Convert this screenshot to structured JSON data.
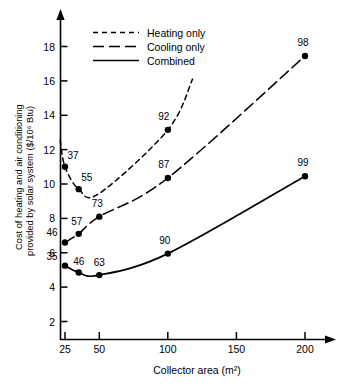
{
  "chart_data": {
    "type": "line",
    "title": "",
    "xlabel": "Collector area (m²)",
    "ylabel": "Cost of heating and air conditioning provided by solar system ($/10⁶ Btu)",
    "ylabel_line1": "Cost of heating and air conditioning",
    "ylabel_line2": "provided by solar system ($/10⁶ Btu)",
    "xlim": [
      20,
      215
    ],
    "ylim": [
      0,
      19.4
    ],
    "xticks": [
      25,
      50,
      100,
      150,
      200
    ],
    "xtick_labels": [
      "25",
      "50",
      "100",
      "150",
      "200"
    ],
    "yticks": [
      2,
      4,
      6,
      8,
      10,
      12,
      14,
      16,
      18
    ],
    "ytick_labels": [
      "2",
      "4",
      "6",
      "8",
      "10",
      "12",
      "14",
      "16",
      "18"
    ],
    "grid": false,
    "legend_position": "top-left-inside",
    "axis_arrows": true,
    "series": [
      {
        "name": "Heating only",
        "style": "short-dashed",
        "color": "#000000",
        "x": [
          25,
          35,
          50,
          100
        ],
        "y": [
          11.0,
          9.7,
          9.45,
          13.15
        ],
        "point_labels": [
          "37",
          "55",
          "",
          "92"
        ],
        "marker_x": [
          25,
          35,
          100
        ],
        "marker_y": [
          11.0,
          9.7,
          13.15
        ],
        "marker_labels": [
          "37",
          "55",
          "92"
        ],
        "extends_beyond_last_point": true
      },
      {
        "name": "Cooling only",
        "style": "long-dashed",
        "color": "#000000",
        "x": [
          25,
          35,
          50,
          100,
          200
        ],
        "y": [
          6.6,
          7.1,
          8.1,
          10.35,
          17.45
        ],
        "point_labels": [
          "46",
          "57",
          "73",
          "87",
          "98"
        ],
        "marker_x": [
          25,
          35,
          50,
          100,
          200
        ],
        "marker_y": [
          6.6,
          7.1,
          8.1,
          10.35,
          17.45
        ],
        "marker_labels": [
          "46",
          "57",
          "73",
          "87",
          "98"
        ]
      },
      {
        "name": "Combined",
        "style": "solid",
        "color": "#000000",
        "x": [
          25,
          35,
          50,
          100,
          200
        ],
        "y": [
          5.25,
          4.85,
          4.7,
          5.95,
          10.45
        ],
        "point_labels": [
          "35",
          "46",
          "63",
          "90",
          "99"
        ],
        "marker_x": [
          25,
          35,
          50,
          100,
          200
        ],
        "marker_y": [
          5.25,
          4.85,
          4.7,
          5.95,
          10.45
        ],
        "marker_labels": [
          "35",
          "46",
          "63",
          "90",
          "99"
        ]
      }
    ],
    "annotations": [
      {
        "text": "37",
        "x": 25,
        "y": 11.0,
        "series": "Heating only"
      },
      {
        "text": "55",
        "x": 35,
        "y": 9.7,
        "series": "Heating only"
      },
      {
        "text": "92",
        "x": 100,
        "y": 13.15,
        "series": "Heating only"
      },
      {
        "text": "46",
        "x": 25,
        "y": 6.6,
        "series": "Cooling only"
      },
      {
        "text": "57",
        "x": 35,
        "y": 7.1,
        "series": "Cooling only"
      },
      {
        "text": "73",
        "x": 50,
        "y": 8.1,
        "series": "Cooling only"
      },
      {
        "text": "87",
        "x": 100,
        "y": 10.35,
        "series": "Cooling only"
      },
      {
        "text": "98",
        "x": 200,
        "y": 17.45,
        "series": "Cooling only"
      },
      {
        "text": "35",
        "x": 25,
        "y": 5.25,
        "series": "Combined"
      },
      {
        "text": "46",
        "x": 35,
        "y": 4.85,
        "series": "Combined"
      },
      {
        "text": "63",
        "x": 50,
        "y": 4.7,
        "series": "Combined"
      },
      {
        "text": "90",
        "x": 100,
        "y": 5.95,
        "series": "Combined"
      },
      {
        "text": "99",
        "x": 200,
        "y": 10.45,
        "series": "Combined"
      }
    ]
  },
  "legend": {
    "items": [
      {
        "label": "Heating only",
        "style": "short-dashed"
      },
      {
        "label": "Cooling only",
        "style": "long-dashed"
      },
      {
        "label": "Combined",
        "style": "solid"
      }
    ]
  },
  "axes": {
    "x_title": "Collector area (m²)",
    "y_title_line1": "Cost of heating and air conditioning",
    "y_title_line2": "provided by solar system ($/10⁶ Btu)",
    "x_tick_labels": [
      "25",
      "50",
      "100",
      "150",
      "200"
    ],
    "y_tick_labels": [
      "2",
      "4",
      "6",
      "8",
      "10",
      "12",
      "14",
      "16",
      "18"
    ]
  },
  "point_labels": {
    "heating": [
      "37",
      "55",
      "92"
    ],
    "cooling": [
      "46",
      "57",
      "73",
      "87",
      "98"
    ],
    "combined": [
      "35",
      "46",
      "63",
      "90",
      "99"
    ]
  },
  "colors": {
    "ink": "#000000",
    "background": "#ffffff"
  }
}
